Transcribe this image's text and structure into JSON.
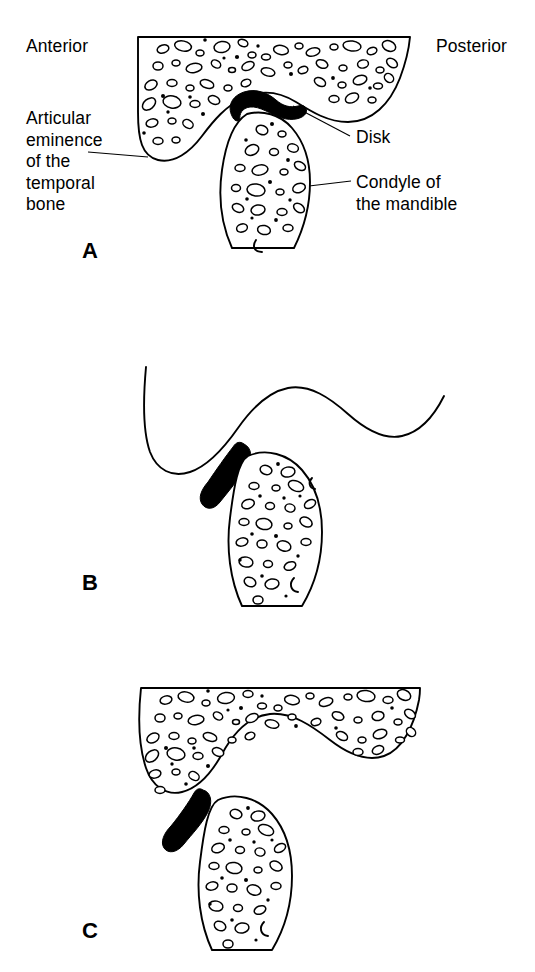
{
  "figure": {
    "background_color": "#ffffff",
    "ink_color": "#000000",
    "panel_count": 3
  },
  "labels": {
    "anterior": "Anterior",
    "posterior": "Posterior",
    "articular_eminence": "Articular\neminence\nof the\ntemporal\nbone",
    "disk": "Disk",
    "condyle": "Condyle of\nthe mandible"
  },
  "panels": [
    {
      "letter": "A",
      "caption_letter": "A",
      "description": "closed mouth position, disk interposed between condyle and articular eminence",
      "has_trabecular_bone": true,
      "disk_orientation": "horizontal crescent"
    },
    {
      "letter": "B",
      "caption_letter": "B",
      "description": "open mouth position, condyle translated forward beneath the eminence",
      "has_trabecular_bone": true,
      "disk_orientation": "oblique, on anterior slope"
    },
    {
      "letter": "C",
      "caption_letter": "C",
      "description": "anteriorly displaced disk positioned in front of the condyle",
      "has_trabecular_bone": true,
      "disk_orientation": "vertical, anterior to condyle"
    }
  ],
  "leaders": [
    {
      "name": "eminence-leader",
      "from_label": "Articular eminence of the temporal bone",
      "to_structure": "articular eminence"
    },
    {
      "name": "disk-leader",
      "from_label": "Disk",
      "to_structure": "articular disk"
    },
    {
      "name": "condyle-leader",
      "from_label": "Condyle of the mandible",
      "to_structure": "mandibular condyle"
    }
  ]
}
